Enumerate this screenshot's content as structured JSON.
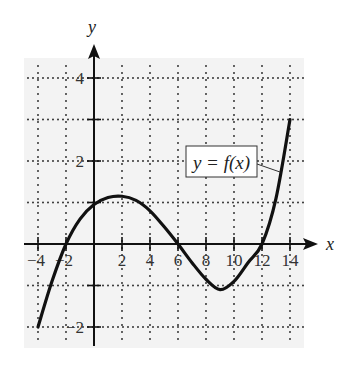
{
  "chart_data": {
    "type": "line",
    "title": "",
    "xlabel": "x",
    "ylabel": "y",
    "xlim": [
      -4,
      14
    ],
    "ylim": [
      -2,
      4.5
    ],
    "grid": true,
    "grid_style": "dotted",
    "x_ticks": [
      -4,
      -2,
      2,
      4,
      6,
      8,
      10,
      12,
      14
    ],
    "x_tick_labels": [
      "−4",
      "−2",
      "2",
      "4",
      "6",
      "8",
      "10",
      "12",
      "14"
    ],
    "y_ticks": [
      4,
      2,
      -2
    ],
    "y_tick_labels": [
      "4",
      "2",
      "−2"
    ],
    "y_grid": [
      4,
      3,
      2,
      1,
      -1,
      -2
    ],
    "series": [
      {
        "name": "y = f(x)",
        "x": [
          -4,
          -3,
          -2,
          -1,
          0,
          1,
          2,
          3,
          4,
          5,
          6,
          7,
          8,
          9,
          10,
          11,
          12,
          13,
          14
        ],
        "values": [
          -2,
          -0.9,
          0,
          0.6,
          0.95,
          1.12,
          1.15,
          1.05,
          0.8,
          0.42,
          0,
          -0.45,
          -0.85,
          -1.1,
          -0.9,
          -0.45,
          0,
          1.1,
          3
        ]
      }
    ],
    "annotations": [
      {
        "text": "y = f(x)",
        "type": "boxed-label",
        "points_to": [
          13.3,
          1.7
        ]
      }
    ],
    "legend": "none"
  },
  "labels": {
    "x_axis": "x",
    "y_axis": "y",
    "curve_label": "y = f(x)"
  },
  "colors": {
    "panel": "#f3f3f3",
    "ink": "#111111",
    "grid": "#333333"
  }
}
